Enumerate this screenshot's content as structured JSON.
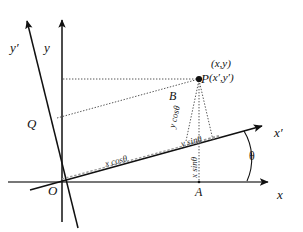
{
  "figure": {
    "background_color": "#ffffff",
    "line_color": "#111111",
    "axes": {
      "y_prime_label": "y′",
      "y_label": "y",
      "x_prime_label": "x′",
      "x_label": "x"
    },
    "points": {
      "origin": "O",
      "foot_a": "A",
      "point_b": "B",
      "point_q": "Q",
      "point_p": "P"
    },
    "point_p_coords": {
      "unprimed": "(x,y)",
      "primed": "(x′,y′)"
    },
    "segments": {
      "x_cos_theta": "x cosθ",
      "y_cos_theta": "y cosθ",
      "y_sin_theta": "y sinθ",
      "x_sin_theta": "x sinθ"
    },
    "angle": {
      "symbol": "θ"
    }
  }
}
